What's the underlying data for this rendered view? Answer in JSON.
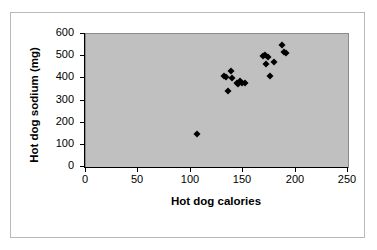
{
  "chart_data": {
    "type": "scatter",
    "title": "",
    "xlabel": "Hot dog calories",
    "ylabel": "Hot dog sodium (mg)",
    "xlim": [
      0,
      250
    ],
    "ylim": [
      0,
      600
    ],
    "xticks": [
      0,
      50,
      100,
      150,
      200,
      250
    ],
    "yticks": [
      0,
      100,
      200,
      300,
      400,
      500,
      600
    ],
    "xtick_labels": [
      "0",
      "50",
      "100",
      "150",
      "200",
      "250"
    ],
    "ytick_labels": [
      "0",
      "100",
      "200",
      "300",
      "400",
      "500",
      "600"
    ],
    "grid": false,
    "legend": null,
    "plot_background": "#c0c0c0",
    "marker_color": "#000000",
    "marker_shape": "diamond",
    "series": [
      {
        "name": "Hot dogs",
        "points": [
          [
            107,
            144
          ],
          [
            133,
            405
          ],
          [
            135,
            400
          ],
          [
            136,
            340
          ],
          [
            139,
            430
          ],
          [
            140,
            395
          ],
          [
            145,
            375
          ],
          [
            146,
            370
          ],
          [
            148,
            385
          ],
          [
            150,
            375
          ],
          [
            153,
            375
          ],
          [
            170,
            495
          ],
          [
            172,
            500
          ],
          [
            173,
            460
          ],
          [
            175,
            490
          ],
          [
            177,
            405
          ],
          [
            180,
            470
          ],
          [
            188,
            545
          ],
          [
            190,
            515
          ],
          [
            192,
            510
          ]
        ]
      }
    ]
  }
}
